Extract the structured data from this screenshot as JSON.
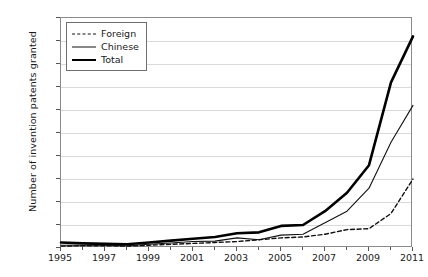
{
  "chart_data": {
    "type": "line",
    "title": "",
    "xlabel": "",
    "ylabel": "Number of invention patents granted",
    "x": [
      1995,
      1996,
      1997,
      1998,
      1999,
      2000,
      2001,
      2002,
      2003,
      2004,
      2005,
      2006,
      2007,
      2008,
      2009,
      2010,
      2011
    ],
    "xtick_labels": [
      "1995",
      "1997",
      "1999",
      "2001",
      "2003",
      "2005",
      "2007",
      "2009",
      "2011"
    ],
    "xtick_values": [
      1995,
      1997,
      1999,
      2001,
      2003,
      2005,
      2007,
      2009,
      2011
    ],
    "ytick_labels": [
      "0",
      "50",
      "100",
      "150",
      "200",
      "250",
      "300",
      "350",
      "400",
      "450",
      "500"
    ],
    "ytick_values": [
      0,
      50,
      100,
      150,
      200,
      250,
      300,
      350,
      400,
      450,
      500
    ],
    "xlim": [
      1995,
      2011
    ],
    "ylim": [
      0,
      500
    ],
    "grid": "horizontal",
    "legend_position": "top-left",
    "series": [
      {
        "name": "Foreign",
        "style": "dashed",
        "color": "#111111",
        "width": 1.4,
        "values": [
          4,
          5,
          5,
          4,
          6,
          8,
          10,
          12,
          14,
          18,
          22,
          24,
          30,
          40,
          42,
          75,
          150
        ]
      },
      {
        "name": "Chinese",
        "style": "solid-thin",
        "color": "#111111",
        "width": 1.1,
        "values": [
          6,
          6,
          6,
          5,
          8,
          11,
          14,
          15,
          22,
          18,
          28,
          30,
          55,
          80,
          130,
          230,
          310
        ]
      },
      {
        "name": "Total",
        "style": "solid-thick",
        "color": "#000000",
        "width": 2.6,
        "values": [
          12,
          10,
          9,
          8,
          12,
          16,
          20,
          24,
          32,
          34,
          48,
          50,
          80,
          120,
          180,
          360,
          460
        ]
      }
    ]
  }
}
